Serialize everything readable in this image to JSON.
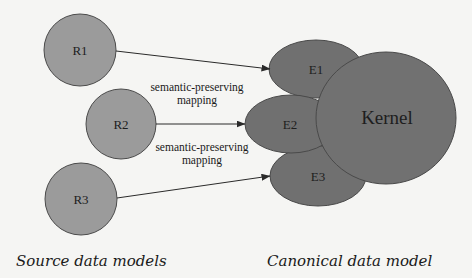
{
  "colors": {
    "background": "#f5f5f3",
    "source_fill": "#9b9b9b",
    "canonical_fill": "#707070",
    "stroke": "#4a4a4a",
    "edge": "#2a2a2a"
  },
  "source_models": {
    "caption": "Source data models",
    "nodes": [
      {
        "id": "R1",
        "label": "R1"
      },
      {
        "id": "R2",
        "label": "R2"
      },
      {
        "id": "R3",
        "label": "R3"
      }
    ]
  },
  "canonical_model": {
    "caption": "Canonical data model",
    "kernel": {
      "label": "Kernel"
    },
    "extensions": [
      {
        "id": "E1",
        "label": "E1"
      },
      {
        "id": "E2",
        "label": "E2"
      },
      {
        "id": "E3",
        "label": "E3"
      }
    ]
  },
  "edges": [
    {
      "from": "R1",
      "to": "E1"
    },
    {
      "from": "R2",
      "to": "E2"
    },
    {
      "from": "R3",
      "to": "E3"
    }
  ],
  "edge_labels": [
    {
      "line1": "semantic-preserving",
      "line2": "mapping"
    },
    {
      "line1": "semantic-preserving",
      "line2": "mapping"
    }
  ]
}
